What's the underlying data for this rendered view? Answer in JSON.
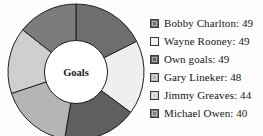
{
  "chart_data": {
    "type": "pie",
    "variant": "donut",
    "title": "",
    "center_label": "Goals",
    "categories": [
      "Bobby Charlton",
      "Wayne Rooney",
      "Own goals",
      "Gary Lineker",
      "Jimmy Greaves",
      "Michael Owen"
    ],
    "values": [
      49,
      49,
      49,
      48,
      44,
      40
    ],
    "total": 279,
    "colors": [
      "#6e6e6e",
      "#efefef",
      "#5f5f5f",
      "#b5b5b5",
      "#cfcfcf",
      "#7c7c7c"
    ],
    "start_angle_deg": 0,
    "direction": "clockwise",
    "inner_radius_ratio": 0.45,
    "legend_position": "right",
    "grid": false,
    "xlabel": "",
    "ylabel": ""
  },
  "legend": {
    "entries": [
      {
        "label": "Bobby Charlton: 49",
        "name": "Bobby Charlton",
        "value": 49,
        "color": "#6e6e6e"
      },
      {
        "label": "Wayne Rooney: 49",
        "name": "Wayne Rooney",
        "value": 49,
        "color": "#efefef"
      },
      {
        "label": "Own goals: 49",
        "name": "Own goals",
        "value": 49,
        "color": "#5f5f5f"
      },
      {
        "label": "Gary Lineker: 48",
        "name": "Gary Lineker",
        "value": 48,
        "color": "#b5b5b5"
      },
      {
        "label": "Jimmy Greaves: 44",
        "name": "Jimmy Greaves",
        "value": 44,
        "color": "#cfcfcf"
      },
      {
        "label": "Michael Owen: 40",
        "name": "Michael Owen",
        "value": 40,
        "color": "#7c7c7c"
      }
    ]
  },
  "style": {
    "background": "#fdfdfd",
    "segment_stroke": "#1f1f1f",
    "hole_fill": "#ffffff",
    "text_color": "#151515"
  }
}
